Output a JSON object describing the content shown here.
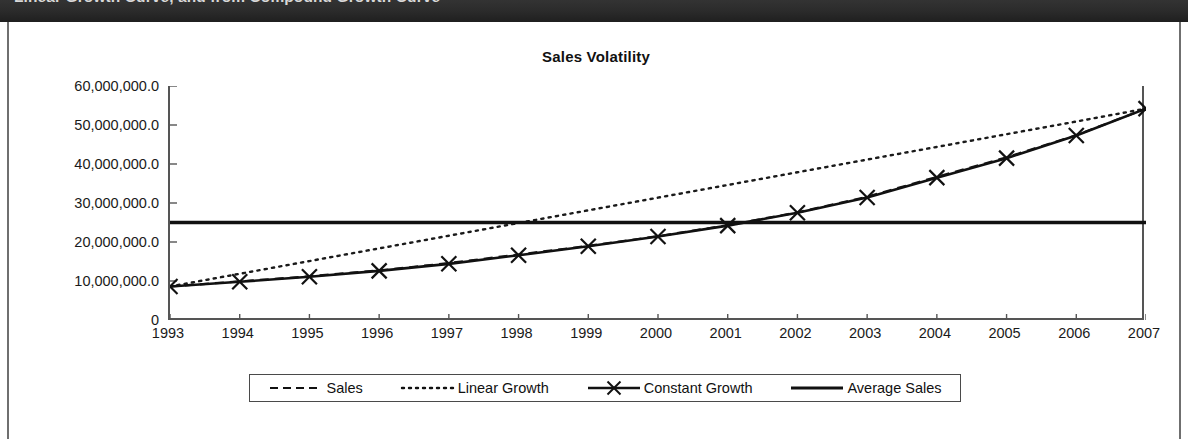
{
  "header": {
    "clipped_title": "Linear Growth Curve, and from Compound Growth Curve"
  },
  "chart_data": {
    "type": "line",
    "title": "Sales Volatility",
    "xlabel": "",
    "ylabel": "",
    "grid": false,
    "legend_position": "bottom",
    "ylim": [
      0,
      60000000
    ],
    "ytick_labels": [
      "60,000,000.0",
      "50,000,000.0",
      "40,000,000.0",
      "30,000,000.0",
      "20,000,000.0",
      "10,000,000.0",
      "0"
    ],
    "ytick_values": [
      60000000,
      50000000,
      40000000,
      30000000,
      20000000,
      10000000,
      0
    ],
    "categories": [
      "1993",
      "1994",
      "1995",
      "1996",
      "1997",
      "1998",
      "1999",
      "2000",
      "2001",
      "2002",
      "2003",
      "2004",
      "2005",
      "2006",
      "2007"
    ],
    "series": [
      {
        "name": "Sales",
        "style": "dashed",
        "marker": "none",
        "color": "#1a1a1a",
        "values": [
          8600000,
          9900000,
          11200000,
          12700000,
          14600000,
          16800000,
          19000000,
          21500000,
          24300000,
          27600000,
          31600000,
          36700000,
          41700000,
          47400000,
          54200000
        ]
      },
      {
        "name": "Linear Growth",
        "style": "dotted",
        "marker": "none",
        "color": "#1a1a1a",
        "values": [
          8600000,
          11850000,
          15110000,
          18360000,
          21610000,
          24870000,
          28120000,
          31370000,
          34620000,
          37880000,
          41130000,
          44380000,
          47640000,
          50890000,
          54200000
        ]
      },
      {
        "name": "Constant Growth",
        "style": "solid",
        "marker": "x",
        "color": "#111111",
        "values": [
          8600000,
          9800000,
          11100000,
          12600000,
          14400000,
          16600000,
          18900000,
          21400000,
          24200000,
          27500000,
          31400000,
          36500000,
          41500000,
          47300000,
          54200000
        ]
      },
      {
        "name": "Average Sales",
        "style": "solid-thick",
        "marker": "none",
        "color": "#111111",
        "constant_value": 25000000,
        "values": [
          25000000,
          25000000,
          25000000,
          25000000,
          25000000,
          25000000,
          25000000,
          25000000,
          25000000,
          25000000,
          25000000,
          25000000,
          25000000,
          25000000,
          25000000
        ]
      }
    ],
    "legend": [
      {
        "label": "Sales",
        "style": "dashed",
        "marker": "none"
      },
      {
        "label": "Linear Growth",
        "style": "dotted",
        "marker": "none"
      },
      {
        "label": "Constant Growth",
        "style": "solid",
        "marker": "x"
      },
      {
        "label": "Average Sales",
        "style": "solid-thick",
        "marker": "none"
      }
    ]
  }
}
